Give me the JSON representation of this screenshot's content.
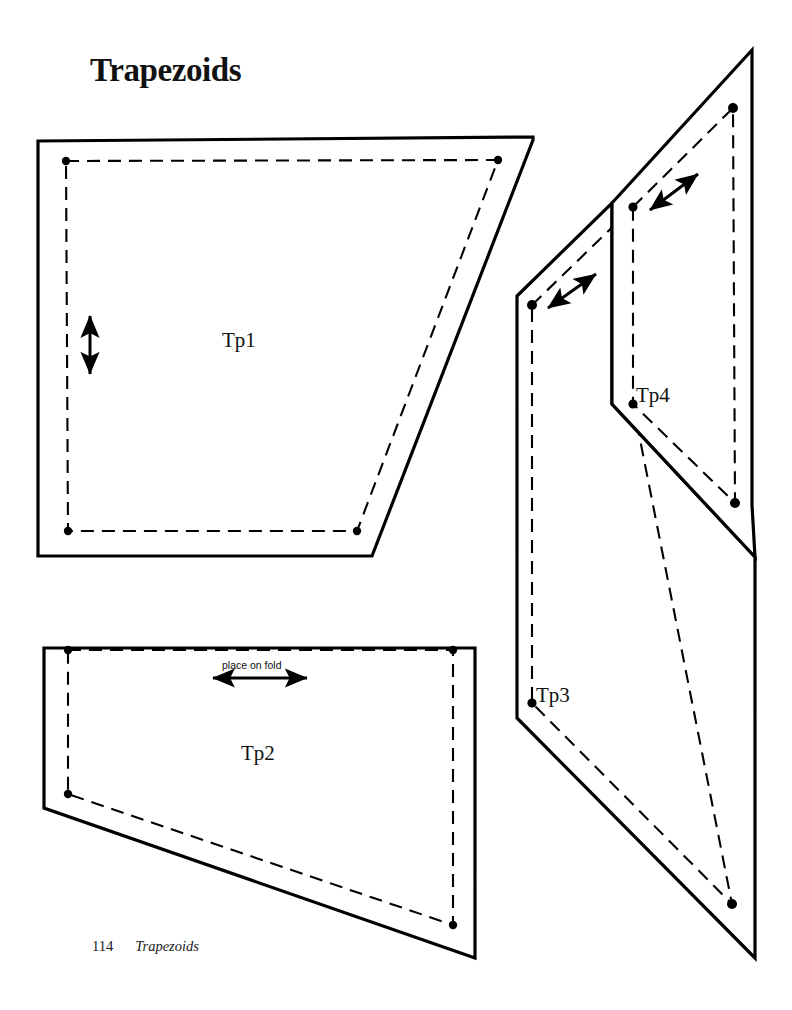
{
  "page": {
    "title": "Trapezoids",
    "background_color": "#ffffff",
    "ink_color": "#000000",
    "width": 792,
    "height": 1010
  },
  "footer": {
    "page_number": "114",
    "section_title": "Trapezoids"
  },
  "pattern": {
    "type": "sewing-pattern-sheet",
    "notation": {
      "solid_line_meaning": "cutting line",
      "dashed_line_meaning": "stitching line",
      "dot_meaning": "corner match point",
      "double_arrow_meaning": "grainline"
    },
    "pieces": [
      {
        "id": "Tp1",
        "label": "Tp1",
        "label_x": 245,
        "label_y": 341,
        "cut_line": "38,141 533,137 533,140 372,556 38,556",
        "stitch_line": "66,161 498,160 357,531 68,531",
        "dots": [
          [
            66,
            161
          ],
          [
            498,
            160
          ],
          [
            357,
            531
          ],
          [
            68,
            531
          ]
        ],
        "grainline": {
          "kind": "vertical",
          "x1": 90,
          "y1": 313,
          "x2": 90,
          "y2": 377
        }
      },
      {
        "id": "Tp2",
        "label": "Tp2",
        "label_x": 263,
        "label_y": 754,
        "fold_note": "place on fold",
        "fold_note_x": 260,
        "fold_note_y": 670,
        "cut_line": "44,648 475,648 475,958 44,808",
        "stitch_line": "68,650 453,650 453,925 68,794",
        "dots": [
          [
            68,
            650
          ],
          [
            453,
            650
          ],
          [
            453,
            925
          ],
          [
            68,
            794
          ]
        ],
        "grainline": {
          "kind": "horizontal",
          "x1": 210,
          "y1": 678,
          "x2": 310,
          "y2": 678
        }
      },
      {
        "id": "Tp3",
        "label": "Tp3",
        "label_x": 540,
        "label_y": 698,
        "cut_line": "517,296 612,203 612,404 755,557 755,958 517,718",
        "stitch_line": "532,305 633,207 633,404 732,904 532,703",
        "dots": [
          [
            532,
            305
          ],
          [
            732,
            904
          ]
        ],
        "grainline": {
          "kind": "diagonal",
          "x1": 546,
          "y1": 309,
          "x2": 598,
          "y2": 272
        }
      },
      {
        "id": "Tp4",
        "label": "Tp4",
        "label_x": 638,
        "label_y": 398,
        "cut_line": "612,203 752,50 752,505 755,557 612,404",
        "stitch_line": "633,207 733,108 735,503 633,404",
        "dots": [
          [
            633,
            207
          ],
          [
            733,
            108
          ],
          [
            735,
            503
          ],
          [
            633,
            404
          ]
        ],
        "grainline": {
          "kind": "diagonal",
          "x1": 648,
          "y1": 211,
          "x2": 700,
          "y2": 172
        }
      }
    ]
  }
}
